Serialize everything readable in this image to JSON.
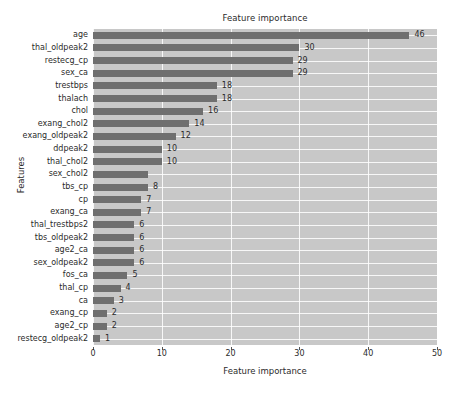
{
  "chart_data": {
    "type": "bar",
    "orientation": "horizontal",
    "title": "Feature importance",
    "xlabel": "Feature importance",
    "ylabel": "Features",
    "xlim": [
      0,
      50
    ],
    "xticks": [
      0,
      10,
      20,
      30,
      40,
      50
    ],
    "xtick_labels": [
      "0",
      "10",
      "20",
      "30",
      "40",
      "50"
    ],
    "grid": true,
    "legend": null,
    "bar_color": "#6f6f6f",
    "plot_background": "#c8c8c8",
    "figure_background": "#ffffff",
    "categories": [
      "age",
      "thal_oldpeak2",
      "restecg_cp",
      "sex_ca",
      "trestbps",
      "thalach",
      "chol",
      "exang_chol2",
      "exang_oldpeak2",
      "ddpeak2",
      "thal_chol2",
      "sex_chol2",
      "tbs_cp",
      "cp",
      "exang_ca",
      "thal_trestbps2",
      "tbs_oldpeak2",
      "age2_ca",
      "sex_oldpeak2",
      "fos_ca",
      "thal_cp",
      "ca",
      "exang_cp",
      "age2_cp",
      "restecg_oldpeak2"
    ],
    "values": [
      46,
      30,
      29,
      29,
      18,
      18,
      16,
      14,
      12,
      10,
      10,
      8,
      8,
      7,
      7,
      6,
      6,
      6,
      6,
      5,
      4,
      3,
      2,
      2,
      1
    ],
    "value_labels": [
      "46",
      "30",
      "29",
      "29",
      "18",
      "18",
      "16",
      "14",
      "12",
      "10",
      "10",
      "",
      "8",
      "7",
      "7",
      "6",
      "6",
      "6",
      "6",
      "5",
      "4",
      "3",
      "2",
      "2",
      "1"
    ]
  }
}
